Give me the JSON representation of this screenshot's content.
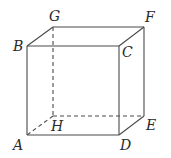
{
  "figure": {
    "type": "cube",
    "vertices": {
      "A": {
        "x": 27,
        "y": 135
      },
      "B": {
        "x": 27,
        "y": 46
      },
      "C": {
        "x": 119,
        "y": 46
      },
      "D": {
        "x": 119,
        "y": 135
      },
      "E": {
        "x": 144,
        "y": 116
      },
      "F": {
        "x": 144,
        "y": 27
      },
      "G": {
        "x": 53,
        "y": 27
      },
      "H": {
        "x": 53,
        "y": 116
      }
    },
    "labels": {
      "A": "A",
      "B": "B",
      "C": "C",
      "D": "D",
      "E": "E",
      "F": "F",
      "G": "G",
      "H": "H"
    },
    "visible_edges": [
      "AB",
      "BC",
      "CD",
      "DA",
      "BG",
      "GF",
      "FC",
      "FE",
      "ED"
    ],
    "hidden_edges": [
      "GH",
      "HE",
      "HA"
    ],
    "stroke_color": "#4a4a4a"
  }
}
